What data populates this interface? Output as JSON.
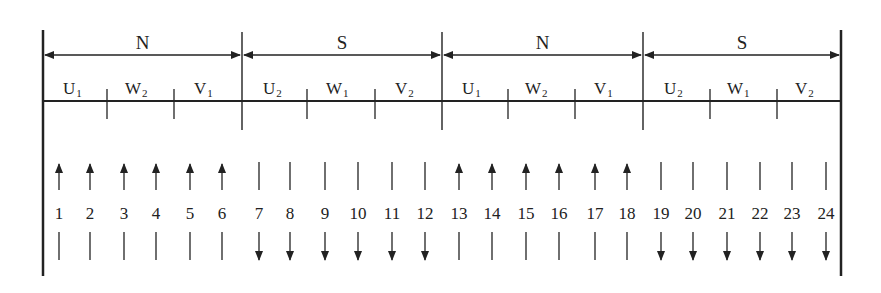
{
  "diagram": {
    "title": "",
    "poles": [
      {
        "label": "N",
        "x1": 43,
        "x2": 242
      },
      {
        "label": "S",
        "x1": 242,
        "x2": 442
      },
      {
        "label": "N",
        "x1": 442,
        "x2": 643
      },
      {
        "label": "S",
        "x1": 643,
        "x2": 841
      }
    ],
    "phase_groups": [
      {
        "base": "U",
        "sub": "1",
        "x": 63
      },
      {
        "base": "W",
        "sub": "2",
        "x": 125
      },
      {
        "base": "V",
        "sub": "1",
        "x": 194
      },
      {
        "base": "U",
        "sub": "2",
        "x": 263
      },
      {
        "base": "W",
        "sub": "1",
        "x": 326
      },
      {
        "base": "V",
        "sub": "2",
        "x": 395
      },
      {
        "base": "U",
        "sub": "1",
        "x": 462
      },
      {
        "base": "W",
        "sub": "2",
        "x": 525
      },
      {
        "base": "V",
        "sub": "1",
        "x": 594
      },
      {
        "base": "U",
        "sub": "2",
        "x": 664
      },
      {
        "base": "W",
        "sub": "1",
        "x": 727
      },
      {
        "base": "V",
        "sub": "2",
        "x": 795
      }
    ],
    "phase_ticks": [
      107,
      174,
      307,
      375,
      508,
      575,
      710,
      777
    ],
    "pole_dividers": [
      242,
      442,
      643
    ],
    "slots": [
      {
        "num": "1",
        "x": 59,
        "dir": "up"
      },
      {
        "num": "2",
        "x": 90,
        "dir": "up"
      },
      {
        "num": "3",
        "x": 124,
        "dir": "up"
      },
      {
        "num": "4",
        "x": 156,
        "dir": "up"
      },
      {
        "num": "5",
        "x": 190,
        "dir": "up"
      },
      {
        "num": "6",
        "x": 222,
        "dir": "up"
      },
      {
        "num": "7",
        "x": 259,
        "dir": "down"
      },
      {
        "num": "8",
        "x": 290,
        "dir": "down"
      },
      {
        "num": "9",
        "x": 325,
        "dir": "down"
      },
      {
        "num": "10",
        "x": 358,
        "dir": "down"
      },
      {
        "num": "11",
        "x": 392,
        "dir": "down"
      },
      {
        "num": "12",
        "x": 425,
        "dir": "down"
      },
      {
        "num": "13",
        "x": 459,
        "dir": "up"
      },
      {
        "num": "14",
        "x": 492,
        "dir": "up"
      },
      {
        "num": "15",
        "x": 526,
        "dir": "up"
      },
      {
        "num": "16",
        "x": 559,
        "dir": "up"
      },
      {
        "num": "17",
        "x": 595,
        "dir": "up"
      },
      {
        "num": "18",
        "x": 627,
        "dir": "up"
      },
      {
        "num": "19",
        "x": 661,
        "dir": "down"
      },
      {
        "num": "20",
        "x": 693,
        "dir": "down"
      },
      {
        "num": "21",
        "x": 727,
        "dir": "down"
      },
      {
        "num": "22",
        "x": 760,
        "dir": "down"
      },
      {
        "num": "23",
        "x": 792,
        "dir": "down"
      },
      {
        "num": "24",
        "x": 826,
        "dir": "down"
      }
    ],
    "colors": {
      "line": "#222222",
      "background": "#ffffff"
    }
  }
}
